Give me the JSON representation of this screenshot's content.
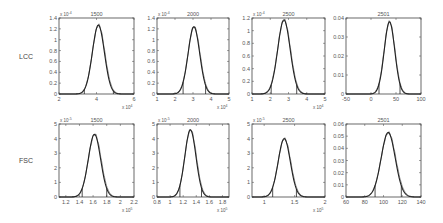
{
  "figure": {
    "row_labels": [
      "LCC",
      "FSC"
    ]
  },
  "chart_data": [
    {
      "type": "line",
      "row": "LCC",
      "title": "1500",
      "xlim": [
        2,
        6
      ],
      "xticks": [
        2,
        4,
        6
      ],
      "xticklabels": [
        "2",
        "4",
        "6"
      ],
      "x_multiplier": "x 10^4",
      "ylim": [
        0,
        1.4
      ],
      "yticks": [
        0,
        0.2,
        0.4,
        0.6,
        0.8,
        1,
        1.2,
        1.4
      ],
      "yticklabels": [
        "0",
        "0.2",
        "0.4",
        "0.6",
        "0.8",
        "1",
        "1.2",
        "1.4"
      ],
      "y_multiplier": "x 10^-4",
      "series": [
        {
          "name": "density fit",
          "mean": 4.1,
          "sd": 0.32,
          "peak": 1.27
        }
      ],
      "vlines": [
        3.35,
        4.9
      ],
      "grid": false
    },
    {
      "type": "line",
      "row": "LCC",
      "title": "2000",
      "xlim": [
        1,
        5
      ],
      "xticks": [
        1,
        2,
        3,
        4,
        5
      ],
      "xticklabels": [
        "1",
        "2",
        "3",
        "4",
        "5"
      ],
      "x_multiplier": "x 10^4",
      "ylim": [
        0,
        1.4
      ],
      "yticks": [
        0,
        0.2,
        0.4,
        0.6,
        0.8,
        1,
        1.2,
        1.4
      ],
      "yticklabels": [
        "0",
        "0.2",
        "0.4",
        "0.6",
        "0.8",
        "1",
        "1.2",
        "1.4"
      ],
      "y_multiplier": "x 10^-4",
      "series": [
        {
          "name": "density fit",
          "mean": 3.05,
          "sd": 0.32,
          "peak": 1.24
        }
      ],
      "vlines": [
        2.45,
        3.7
      ],
      "grid": false
    },
    {
      "type": "line",
      "row": "LCC",
      "title": "2500",
      "xlim": [
        1,
        5
      ],
      "xticks": [
        1,
        2,
        3,
        4,
        5
      ],
      "xticklabels": [
        "1",
        "2",
        "3",
        "4",
        "5"
      ],
      "x_multiplier": "x 10^4",
      "ylim": [
        0,
        1.2
      ],
      "yticks": [
        0,
        0.2,
        0.4,
        0.6,
        0.8,
        1,
        1.2
      ],
      "yticklabels": [
        "0",
        "0.2",
        "0.4",
        "0.6",
        "0.8",
        "1",
        "1.2"
      ],
      "y_multiplier": "x 10^-4",
      "series": [
        {
          "name": "density fit",
          "mean": 2.75,
          "sd": 0.34,
          "peak": 1.17
        }
      ],
      "vlines": [
        2.05,
        3.45
      ],
      "grid": false
    },
    {
      "type": "line",
      "row": "LCC",
      "title": "2501",
      "xlim": [
        -50,
        100
      ],
      "xticks": [
        -50,
        0,
        50,
        100
      ],
      "xticklabels": [
        "-50",
        "0",
        "50",
        "100"
      ],
      "x_multiplier": "",
      "ylim": [
        0,
        0.04
      ],
      "yticks": [
        0,
        0.01,
        0.02,
        0.03,
        0.04
      ],
      "yticklabels": [
        "0",
        "0.01",
        "0.02",
        "0.03",
        "0.04"
      ],
      "y_multiplier": "",
      "series": [
        {
          "name": "density fit",
          "mean": 37,
          "sd": 10.5,
          "peak": 0.038
        }
      ],
      "vlines": [
        16,
        58
      ],
      "grid": false
    },
    {
      "type": "line",
      "row": "FSC",
      "title": "1500",
      "xlim": [
        1.1,
        2.2
      ],
      "xticks": [
        1.2,
        1.4,
        1.6,
        1.8,
        2,
        2.2
      ],
      "xticklabels": [
        "1.2",
        "1.4",
        "1.6",
        "1.8",
        "2",
        "2.2"
      ],
      "x_multiplier": "x 10^5",
      "ylim": [
        0,
        5
      ],
      "yticks": [
        0,
        1,
        2,
        3,
        4,
        5
      ],
      "yticklabels": [
        "0",
        "1",
        "2",
        "3",
        "4",
        "5"
      ],
      "y_multiplier": "x 10^-5",
      "series": [
        {
          "name": "density fit",
          "mean": 1.62,
          "sd": 0.09,
          "peak": 4.3
        }
      ],
      "vlines": [
        1.44,
        1.8
      ],
      "grid": false
    },
    {
      "type": "line",
      "row": "FSC",
      "title": "2000",
      "xlim": [
        0.8,
        1.9
      ],
      "xticks": [
        0.8,
        1,
        1.2,
        1.4,
        1.6,
        1.8
      ],
      "xticklabels": [
        "0.8",
        "1",
        "1.2",
        "1.4",
        "1.6",
        "1.8"
      ],
      "x_multiplier": "x 10^5",
      "ylim": [
        0,
        5
      ],
      "yticks": [
        0,
        1,
        2,
        3,
        4,
        5
      ],
      "yticklabels": [
        "0",
        "1",
        "2",
        "3",
        "4",
        "5"
      ],
      "y_multiplier": "x 10^-5",
      "series": [
        {
          "name": "density fit",
          "mean": 1.31,
          "sd": 0.085,
          "peak": 4.6
        }
      ],
      "vlines": [
        1.15,
        1.48
      ],
      "grid": false
    },
    {
      "type": "line",
      "row": "FSC",
      "title": "2500",
      "xlim": [
        0.8,
        2
      ],
      "xticks": [
        1,
        1.5,
        2
      ],
      "xticklabels": [
        "1",
        "1.5",
        "2"
      ],
      "x_multiplier": "x 10^5",
      "ylim": [
        0,
        5
      ],
      "yticks": [
        0,
        1,
        2,
        3,
        4,
        5
      ],
      "yticklabels": [
        "0",
        "1",
        "2",
        "3",
        "4",
        "5"
      ],
      "y_multiplier": "x 10^-5",
      "series": [
        {
          "name": "density fit",
          "mean": 1.33,
          "sd": 0.1,
          "peak": 4.0
        }
      ],
      "vlines": [
        1.14,
        1.53
      ],
      "grid": false
    },
    {
      "type": "line",
      "row": "FSC",
      "title": "2501",
      "xlim": [
        60,
        140
      ],
      "xticks": [
        60,
        80,
        100,
        120,
        140
      ],
      "xticklabels": [
        "60",
        "80",
        "100",
        "120",
        "140"
      ],
      "x_multiplier": "",
      "ylim": [
        0,
        0.06
      ],
      "yticks": [
        0,
        0.01,
        0.02,
        0.03,
        0.04,
        0.05,
        0.06
      ],
      "yticklabels": [
        "0",
        "0.01",
        "0.02",
        "0.03",
        "0.04",
        "0.05",
        "0.06"
      ],
      "y_multiplier": "",
      "series": [
        {
          "name": "density fit",
          "mean": 105,
          "sd": 7.5,
          "peak": 0.053
        }
      ],
      "vlines": [
        91,
        119
      ],
      "grid": false
    }
  ]
}
